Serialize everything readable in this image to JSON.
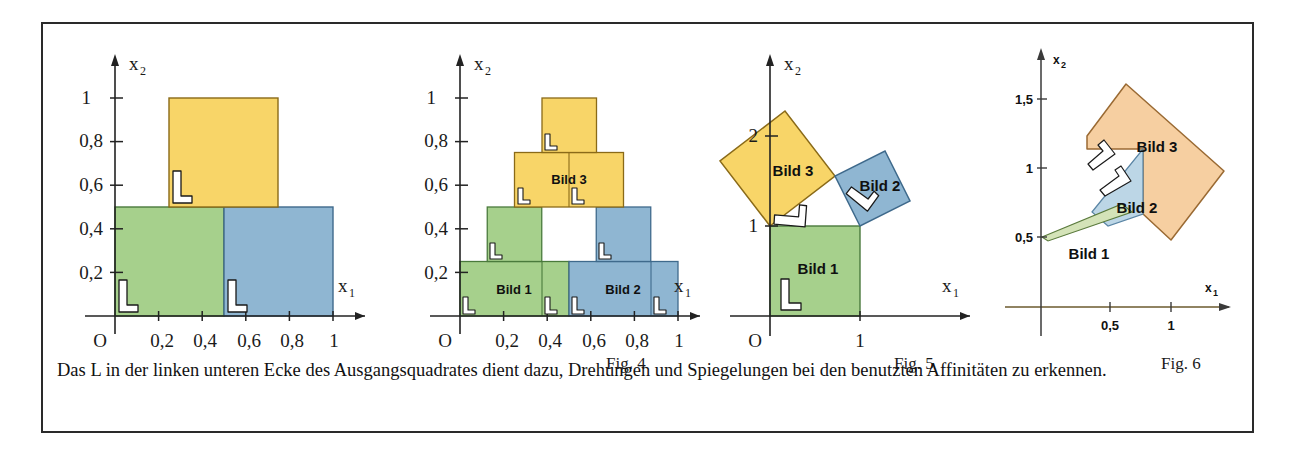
{
  "caption": {
    "text": "Das L in der linken unteren Ecke des Ausgangsquadrates dient dazu, Drehungen und Spiegelungen bei den benutzten Affinitäten zu erkennen."
  },
  "colors": {
    "green": "#a6d08c",
    "green_edge": "#4a7a3c",
    "blue": "#8fb6d2",
    "blue_edge": "#3f6a8c",
    "yellow": "#f8d568",
    "yellow_edge": "#8a6a18",
    "orange": "#f6cfa1",
    "orange_edge": "#9a6a33",
    "blue_pale": "#bcd6e6",
    "green_pale": "#d4e3b8",
    "axis": "#222222",
    "axis_fig6": "#6b5a2e",
    "frame": "#2a2a2a",
    "text": "#111111"
  },
  "figures": [
    {
      "id": "fig3",
      "label": "",
      "axes": {
        "x_name": "x",
        "x_sub": "1",
        "y_name": "x",
        "y_sub": "2",
        "origin_label": "O",
        "x_ticks": [
          "0,2",
          "0,4",
          "0,6",
          "0,8",
          "1"
        ],
        "y_ticks": [
          "0,2",
          "0,4",
          "0,6",
          "0,8",
          "1"
        ]
      },
      "shapes": [
        {
          "name": "green-square",
          "fill": "green",
          "label": ""
        },
        {
          "name": "blue-square",
          "fill": "blue",
          "label": ""
        },
        {
          "name": "yellow-square",
          "fill": "yellow",
          "label": ""
        }
      ],
      "l_markers": 3
    },
    {
      "id": "fig4",
      "label": "Fig. 4",
      "axes": {
        "x_name": "x",
        "x_sub": "1",
        "y_name": "x",
        "y_sub": "2",
        "origin_label": "O",
        "x_ticks": [
          "0,2",
          "0,4",
          "0,6",
          "0,8",
          "1"
        ],
        "y_ticks": [
          "0,2",
          "0,4",
          "0,6",
          "0,8",
          "1"
        ]
      },
      "shapes": [
        {
          "name": "bild1-green",
          "fill": "green",
          "label": "Bild 1"
        },
        {
          "name": "bild2-blue",
          "fill": "blue",
          "label": "Bild 2"
        },
        {
          "name": "bild3-yellow",
          "fill": "yellow",
          "label": "Bild 3"
        }
      ],
      "l_markers": 7
    },
    {
      "id": "fig5",
      "label": "Fig. 5",
      "axes": {
        "x_name": "x",
        "x_sub": "1",
        "y_name": "x",
        "y_sub": "2",
        "origin_label": "O",
        "x_ticks": [
          "1"
        ],
        "y_ticks": [
          "1",
          "2"
        ]
      },
      "shapes": [
        {
          "name": "bild1-green",
          "fill": "green",
          "label": "Bild 1"
        },
        {
          "name": "bild2-blue",
          "fill": "blue",
          "label": "Bild 2"
        },
        {
          "name": "bild3-yellow",
          "fill": "yellow",
          "label": "Bild 3"
        }
      ],
      "l_markers": 3
    },
    {
      "id": "fig6",
      "label": "Fig. 6",
      "axes": {
        "x_name": "x",
        "x_sub": "1",
        "y_name": "x",
        "y_sub": "2",
        "origin_label": "",
        "x_ticks": [
          "0,5",
          "1"
        ],
        "y_ticks": [
          "0,5",
          "1",
          "1,5"
        ]
      },
      "shapes": [
        {
          "name": "bild1-sliver",
          "fill": "green_pale",
          "label": "Bild 1"
        },
        {
          "name": "bild2-parallelogram",
          "fill": "blue_pale",
          "label": "Bild 2"
        },
        {
          "name": "bild3-diamond",
          "fill": "orange",
          "label": "Bild 3"
        }
      ],
      "l_markers": 2
    }
  ]
}
